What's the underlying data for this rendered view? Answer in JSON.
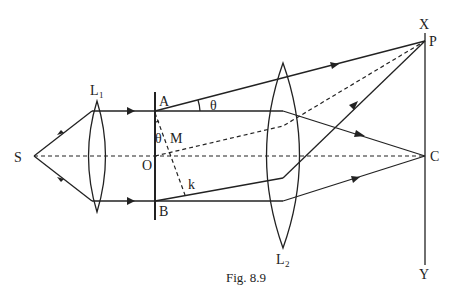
{
  "figure": {
    "caption": "Fig. 8.9",
    "labels": {
      "source": "S",
      "lens1": "L",
      "lens1_sub": "1",
      "lens2": "L",
      "lens2_sub": "2",
      "slit_top": "A",
      "slit_bottom": "B",
      "center": "O",
      "foot": "M",
      "k": "k",
      "theta_top": "θ",
      "theta_slit": "θ",
      "screen_top": "X",
      "screen_bottom": "Y",
      "point_p": "P",
      "point_c": "C"
    },
    "colors": {
      "stroke": "#222222",
      "background": "#ffffff"
    }
  }
}
